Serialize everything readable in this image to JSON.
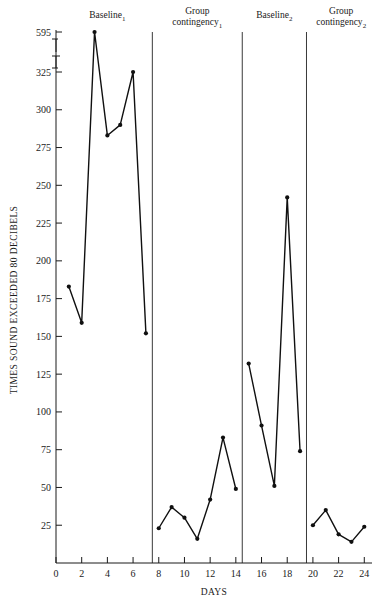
{
  "chart_data": {
    "type": "line",
    "title": "",
    "xlabel": "DAYS",
    "ylabel": "TIMES SOUND EXCEEDED 80 DECIBELS",
    "xlim": [
      0,
      24.6
    ],
    "ylim": [
      0,
      595
    ],
    "grid": false,
    "legend_position": "none",
    "axis_break": {
      "present": true,
      "below": 325,
      "above": 595,
      "note": "y-axis broken between 325 and 595"
    },
    "x_ticks": [
      0,
      2,
      4,
      6,
      8,
      10,
      12,
      14,
      16,
      18,
      20,
      22,
      24
    ],
    "x_tick_labels": [
      "0",
      "2",
      "4",
      "6",
      "8",
      "10",
      "12",
      "14",
      "16",
      "18",
      "20",
      "22",
      "24"
    ],
    "y_ticks": [
      25,
      50,
      75,
      100,
      125,
      150,
      175,
      200,
      225,
      250,
      275,
      300,
      325,
      595
    ],
    "y_tick_labels": [
      "25",
      "50",
      "75",
      "100",
      "125",
      "150",
      "175",
      "200",
      "225",
      "250",
      "275",
      "300",
      "325",
      "595"
    ],
    "x": [
      1,
      2,
      3,
      4,
      5,
      6,
      7,
      8,
      9,
      10,
      11,
      12,
      13,
      14,
      15,
      16,
      17,
      18,
      19,
      20,
      21,
      22,
      23,
      24
    ],
    "series": [
      {
        "name": "Times sound exceeded 80 decibels",
        "segments": [
          {
            "phase": "Baseline 1",
            "x": [
              1,
              2,
              3,
              4,
              5,
              6,
              7
            ],
            "values": [
              183,
              159,
              595,
              283,
              290,
              325,
              152
            ]
          },
          {
            "phase": "Group contingency 1",
            "x": [
              8,
              9,
              10,
              11,
              12,
              13,
              14
            ],
            "values": [
              23,
              37,
              30,
              16,
              42,
              83,
              49
            ]
          },
          {
            "phase": "Baseline 2",
            "x": [
              15,
              16,
              17,
              18,
              19
            ],
            "values": [
              132,
              91,
              51,
              242,
              74
            ]
          },
          {
            "phase": "Group contingency 2",
            "x": [
              20,
              21,
              22,
              23,
              24
            ],
            "values": [
              25,
              35,
              19,
              14,
              24
            ]
          }
        ]
      }
    ],
    "phases": [
      {
        "label": "Baseline",
        "subscript": "1",
        "x_start": 0.4,
        "x_end": 7.5,
        "label_x": 4.0
      },
      {
        "label": "Group contingency",
        "subscript": "1",
        "x_start": 7.5,
        "x_end": 14.5,
        "label_x": 11.0
      },
      {
        "label": "Baseline",
        "subscript": "2",
        "x_start": 14.5,
        "x_end": 19.5,
        "label_x": 17.0
      },
      {
        "label": "Group contingency",
        "subscript": "2",
        "x_start": 19.5,
        "x_end": 24.6,
        "label_x": 22.2
      }
    ],
    "phase_dividers": [
      7.5,
      14.5,
      19.5
    ],
    "annotations": []
  }
}
